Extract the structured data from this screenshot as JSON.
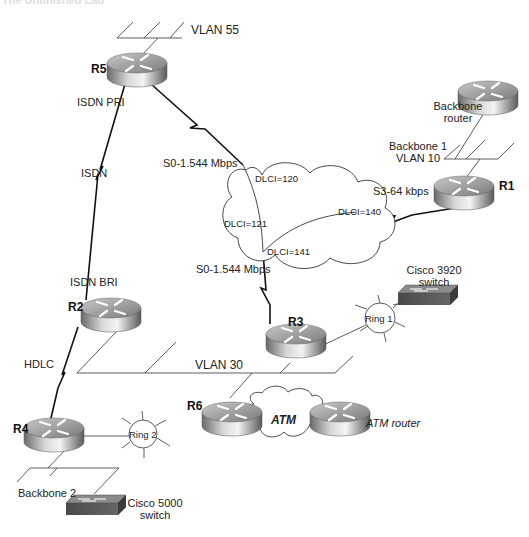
{
  "title": "The Unfinished Lab",
  "routers": {
    "r5": {
      "label": "R5"
    },
    "r1": {
      "label": "R1"
    },
    "r2": {
      "label": "R2"
    },
    "r3": {
      "label": "R3"
    },
    "r4": {
      "label": "R4"
    },
    "r6": {
      "label": "R6"
    },
    "backbone_router": {
      "label_line1": "Backbone",
      "label_line2": "router"
    },
    "atm_router": {
      "label": "ATM router"
    }
  },
  "lans": {
    "vlan55": "VLAN 55",
    "backbone1_line1": "Backbone 1",
    "backbone1_line2": "VLAN 10",
    "vlan30": "VLAN 30",
    "backbone2": "Backbone 2"
  },
  "links": {
    "isdn_pri": "ISDN PRI",
    "isdn": "ISDN",
    "isdn_bri": "ISDN BRI",
    "hdlc": "HDLC",
    "s0_top": "S0-1.544 Mbps",
    "s0_bottom": "S0-1.544 Mbps",
    "s3": "S3-64 kbps"
  },
  "frame_relay": {
    "dlci_120": "DLCI=120",
    "dlci_121": "DLCI=121",
    "dlci_140": "DLCI=140",
    "dlci_141": "DLCI=141"
  },
  "rings": {
    "ring1": "Ring 1",
    "ring2": "Ring 2"
  },
  "switches": {
    "cisco3920_line1": "Cisco 3920",
    "cisco3920_line2": "switch",
    "cisco5000_line1": "Cisco 5000",
    "cisco5000_line2": "switch"
  },
  "atm_cloud": {
    "label": "ATM"
  }
}
